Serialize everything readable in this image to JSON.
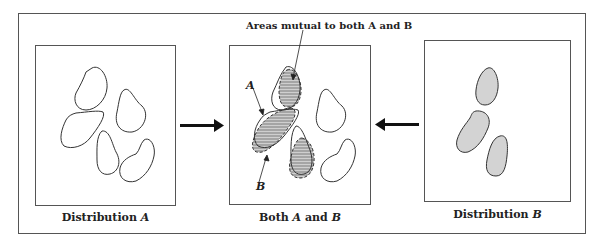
{
  "figure": {
    "panels": [
      {
        "id": "distribution-a",
        "caption_prefix": "Distribution ",
        "caption_var": "A"
      },
      {
        "id": "both",
        "caption_pre": "Both ",
        "caption_a": "A",
        "caption_mid": " and ",
        "caption_b": "B"
      },
      {
        "id": "distribution-b",
        "caption_prefix": "Distribution ",
        "caption_var": "B"
      }
    ],
    "annotations": {
      "mutual_label": "Areas mutual to both A and B",
      "label_a": "A",
      "label_b": "B"
    },
    "colors": {
      "shaded": "#cfcfcf",
      "stroke": "#333333"
    }
  }
}
